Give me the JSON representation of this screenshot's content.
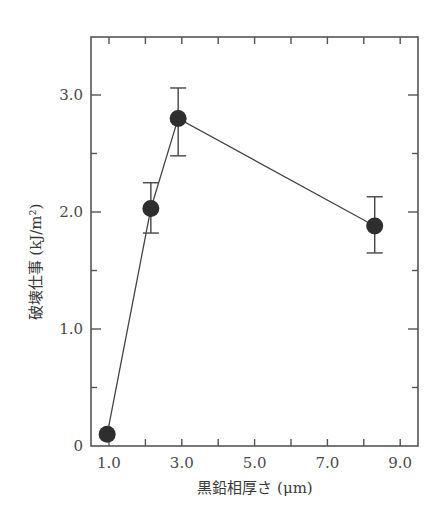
{
  "chart_data": {
    "type": "line",
    "title": "",
    "xlabel": "黒鉛相厚さ (μm)",
    "ylabel": "破壊仕事 (kJ/m²)",
    "xlim": [
      0.5,
      9.5
    ],
    "ylim": [
      0,
      3.45
    ],
    "x_ticks": [
      "1.0",
      "3.0",
      "5.0",
      "7.0",
      "9.0"
    ],
    "x_tick_values": [
      1.0,
      3.0,
      5.0,
      7.0,
      9.0
    ],
    "x_minor_ticks": [
      2.0,
      4.0,
      6.0,
      8.0
    ],
    "y_ticks": [
      "0",
      "1.0",
      "2.0",
      "3.0"
    ],
    "y_tick_values": [
      0,
      1.0,
      2.0,
      3.0
    ],
    "y_minor_ticks": [
      0.5,
      1.5,
      2.5
    ],
    "grid": false,
    "legend": null,
    "series": [
      {
        "name": "破壊仕事",
        "x": [
          0.95,
          2.15,
          2.9,
          8.3
        ],
        "y": [
          0.1,
          2.03,
          2.8,
          1.88
        ],
        "error_upper": [
          null,
          2.25,
          3.06,
          2.13
        ],
        "error_lower": [
          null,
          1.82,
          2.48,
          1.65
        ],
        "marker": "filled-circle",
        "color": "#2e2e2e"
      }
    ]
  }
}
